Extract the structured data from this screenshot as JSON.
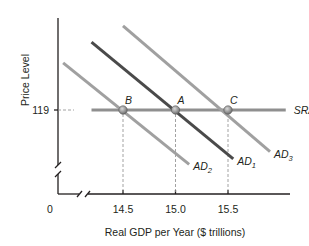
{
  "chart_data": {
    "type": "line",
    "title": "",
    "xlabel": "Real GDP per Year ($ trillions)",
    "ylabel": "Price Level",
    "x_ticks": [
      {
        "value": 0,
        "label": "0"
      },
      {
        "value": 14.5,
        "label": "14.5"
      },
      {
        "value": 15.0,
        "label": "15.0"
      },
      {
        "value": 15.5,
        "label": "15.5"
      }
    ],
    "y_ticks": [
      {
        "value": 119,
        "label": "119"
      }
    ],
    "axis_breaks": {
      "x": true,
      "y": true
    },
    "grid": false,
    "legend": "none",
    "series": [
      {
        "name": "SRAS",
        "label_main": "SRAS",
        "label_sub": "",
        "color": "#8f8f8f",
        "points": [
          {
            "x": 14.2,
            "y": 119
          },
          {
            "x": 16.05,
            "y": 119
          }
        ]
      },
      {
        "name": "AD1",
        "label_main": "AD",
        "label_sub": "1",
        "color": "#4a4a4a",
        "points": [
          {
            "x": 14.2,
            "y": 126.5
          },
          {
            "x": 15.55,
            "y": 113.6
          }
        ]
      },
      {
        "name": "AD2",
        "label_main": "AD",
        "label_sub": "2",
        "color": "#a0a0a0",
        "points": [
          {
            "x": 13.93,
            "y": 124.2
          },
          {
            "x": 15.13,
            "y": 113.0
          }
        ]
      },
      {
        "name": "AD3",
        "label_main": "AD",
        "label_sub": "3",
        "color": "#a0a0a0",
        "points": [
          {
            "x": 14.5,
            "y": 128.3
          },
          {
            "x": 15.9,
            "y": 114.4
          }
        ]
      }
    ],
    "equilibrium_points": [
      {
        "label": "B",
        "x": 14.5,
        "y": 119
      },
      {
        "label": "A",
        "x": 15.0,
        "y": 119
      },
      {
        "label": "C",
        "x": 15.5,
        "y": 119
      }
    ],
    "annotations": []
  }
}
